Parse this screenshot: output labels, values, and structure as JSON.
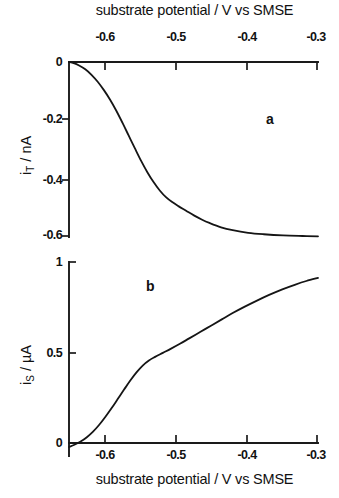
{
  "figure": {
    "top_axis_title": "substrate potential / V vs SMSE",
    "bottom_axis_title": "substrate potential / V vs SMSE",
    "panel_a_letter": "a",
    "panel_b_letter": "b",
    "panel_a_ylabel_main": "i",
    "panel_a_ylabel_sub": "T",
    "panel_a_ylabel_unit": " / nA",
    "panel_b_ylabel_main": "i",
    "panel_b_ylabel_sub": "S",
    "panel_b_ylabel_unit": " / µA",
    "x_ticks": [
      "-0.6",
      "-0.5",
      "-0.4",
      "-0.3"
    ],
    "panel_a_y_ticks": [
      "0",
      "-0.2",
      "-0.4",
      "-0.6"
    ],
    "panel_b_y_ticks": [
      "1",
      "0.5",
      "0"
    ],
    "line_color": "#151515",
    "axis_color": "#1a1a1a"
  },
  "chart_data": [
    {
      "type": "line",
      "panel": "a",
      "title": "",
      "xlabel": "substrate potential / V vs SMSE",
      "ylabel": "i_T / nA",
      "xlim": [
        -0.621,
        -0.3
      ],
      "ylim": [
        -0.645,
        0.018
      ],
      "xticks": [
        -0.6,
        -0.5,
        -0.4,
        -0.3
      ],
      "yticks": [
        0,
        -0.2,
        -0.4,
        -0.6
      ],
      "grid": false,
      "legend": "none",
      "axis_position": "top",
      "x": [
        -0.621,
        -0.615,
        -0.608,
        -0.6,
        -0.592,
        -0.584,
        -0.576,
        -0.568,
        -0.56,
        -0.552,
        -0.544,
        -0.536,
        -0.528,
        -0.52,
        -0.512,
        -0.504,
        -0.496,
        -0.488,
        -0.48,
        -0.47,
        -0.46,
        -0.45,
        -0.44,
        -0.425,
        -0.41,
        -0.39,
        -0.37,
        -0.345,
        -0.32,
        -0.3
      ],
      "y": [
        0.0,
        -0.004,
        -0.012,
        -0.025,
        -0.044,
        -0.068,
        -0.097,
        -0.13,
        -0.168,
        -0.21,
        -0.254,
        -0.298,
        -0.341,
        -0.38,
        -0.414,
        -0.443,
        -0.466,
        -0.483,
        -0.497,
        -0.513,
        -0.529,
        -0.543,
        -0.555,
        -0.57,
        -0.58,
        -0.589,
        -0.594,
        -0.598,
        -0.6,
        -0.601
      ]
    },
    {
      "type": "line",
      "panel": "b",
      "title": "",
      "xlabel": "substrate potential / V vs SMSE",
      "ylabel": "i_S / µA",
      "xlim": [
        -0.621,
        -0.3
      ],
      "ylim": [
        -0.035,
        1.0
      ],
      "xticks": [
        -0.6,
        -0.5,
        -0.4,
        -0.3
      ],
      "yticks": [
        0,
        0.5,
        1
      ],
      "grid": false,
      "legend": "none",
      "axis_position": "bottom",
      "x": [
        -0.621,
        -0.614,
        -0.606,
        -0.598,
        -0.59,
        -0.582,
        -0.574,
        -0.566,
        -0.558,
        -0.55,
        -0.542,
        -0.534,
        -0.526,
        -0.518,
        -0.51,
        -0.5,
        -0.49,
        -0.478,
        -0.466,
        -0.452,
        -0.438,
        -0.424,
        -0.41,
        -0.395,
        -0.38,
        -0.363,
        -0.346,
        -0.33,
        -0.315,
        -0.3
      ],
      "y": [
        -0.022,
        -0.01,
        0.008,
        0.032,
        0.063,
        0.101,
        0.145,
        0.193,
        0.244,
        0.295,
        0.345,
        0.39,
        0.428,
        0.456,
        0.476,
        0.498,
        0.52,
        0.548,
        0.578,
        0.613,
        0.648,
        0.683,
        0.718,
        0.752,
        0.784,
        0.818,
        0.849,
        0.874,
        0.895,
        0.912
      ]
    }
  ]
}
